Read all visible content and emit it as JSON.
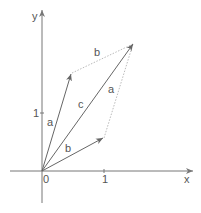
{
  "diagram": {
    "type": "vector-parallelogram",
    "axes": {
      "x_label": "x",
      "y_label": "y",
      "origin_label": "0",
      "x_tick_label": "1",
      "y_tick_label": "1"
    },
    "vectors": [
      {
        "name": "a",
        "label": "a",
        "from": [
          0,
          0
        ],
        "to": [
          0.5,
          1.6
        ]
      },
      {
        "name": "b",
        "label": "b",
        "from": [
          0,
          0
        ],
        "to": [
          1.0,
          0.5
        ]
      },
      {
        "name": "c",
        "label": "c",
        "from": [
          0,
          0
        ],
        "to": [
          1.5,
          2.1
        ]
      }
    ],
    "parallelogram_sides": [
      {
        "label": "b",
        "from": "tip of a",
        "to": "tip of c"
      },
      {
        "label": "a",
        "from": "tip of b",
        "to": "tip of c"
      }
    ],
    "colors": {
      "axis": "#777777",
      "vector": "#666666",
      "dotted": "#bbbbbb",
      "text": "#555555"
    }
  }
}
